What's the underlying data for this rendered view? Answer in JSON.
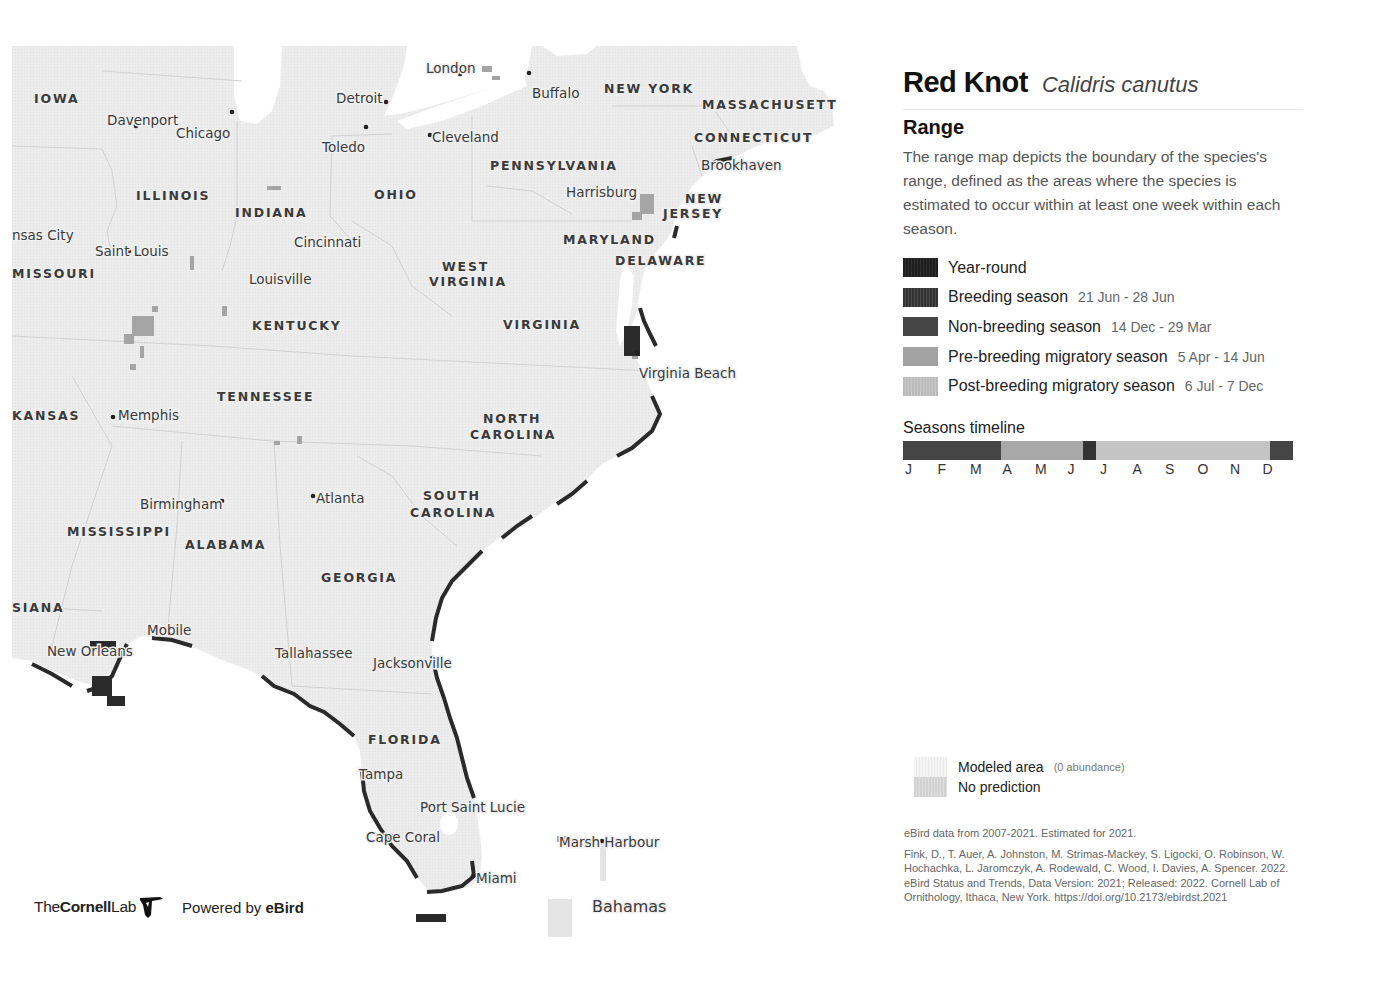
{
  "species": {
    "common_name": "Red Knot",
    "scientific_name": "Calidris canutus"
  },
  "range": {
    "heading": "Range",
    "description": "The range map depicts the boundary of the species's range, defined as the areas where the species is estimated to occur within at least one week within each season."
  },
  "legend": {
    "items": [
      {
        "label": "Year-round",
        "dates": "",
        "color": "#222222"
      },
      {
        "label": "Breeding season",
        "dates": "21 Jun - 28 Jun",
        "color": "#3e3e3e"
      },
      {
        "label": "Non-breeding season",
        "dates": "14 Dec - 29 Mar",
        "color": "#454545"
      },
      {
        "label": "Pre-breeding migratory season",
        "dates": "5 Apr - 14 Jun",
        "color": "#a2a2a2"
      },
      {
        "label": "Post-breeding migratory season",
        "dates": "6 Jul - 7 Dec",
        "color": "#bdbdbd"
      }
    ]
  },
  "timeline": {
    "title": "Seasons timeline",
    "months": [
      "J",
      "F",
      "M",
      "A",
      "M",
      "J",
      "J",
      "A",
      "S",
      "O",
      "N",
      "D"
    ],
    "segments": [
      {
        "season": "non-breeding",
        "start_pct": 0,
        "width_pct": 25,
        "color": "#454545"
      },
      {
        "season": "pre-breeding",
        "start_pct": 25,
        "width_pct": 21.2,
        "color": "#a8a8a8"
      },
      {
        "season": "breeding",
        "start_pct": 46.2,
        "width_pct": 3.4,
        "color": "#333333"
      },
      {
        "season": "post-breeding",
        "start_pct": 49.6,
        "width_pct": 44.4,
        "color": "#c4c4c4"
      },
      {
        "season": "non-breeding",
        "start_pct": 94,
        "width_pct": 6,
        "color": "#454545"
      }
    ]
  },
  "auxiliary_legend": {
    "modeled": {
      "label": "Modeled area",
      "note": "(0 abundance)",
      "color": "#f2f2f2"
    },
    "no_prediction": {
      "label": "No prediction",
      "color": "#d6d6d6"
    }
  },
  "citation": {
    "data_note": "eBird data from 2007-2021. Estimated for 2021.",
    "reference": "Fink, D., T. Auer, A. Johnston, M. Strimas-Mackey, S. Ligocki, O. Robinson, W. Hochachka, L. Jaromczyk, A. Rodewald, C. Wood, I. Davies, A. Spencer. 2022. eBird Status and Trends, Data Version: 2021; Released: 2022. Cornell Lab of Ornithology, Ithaca, New York. https://doi.org/10.2173/ebirdst.2021"
  },
  "footer": {
    "logo_the": "The",
    "logo_cornell": "Cornell",
    "logo_lab": "Lab",
    "powered_by": "Powered by ",
    "ebird": "eBird"
  },
  "map": {
    "states": [
      {
        "name": "IOWA",
        "x": 22,
        "y": 46
      },
      {
        "name": "ILLINOIS",
        "x": 124,
        "y": 143
      },
      {
        "name": "INDIANA",
        "x": 223,
        "y": 160
      },
      {
        "name": "OHIO",
        "x": 362,
        "y": 142
      },
      {
        "name": "NEW YORK",
        "x": 592,
        "y": 36
      },
      {
        "name": "MASSACHUSETTS",
        "x": 690,
        "y": 52
      },
      {
        "name": "CONNECTICUT",
        "x": 682,
        "y": 85
      },
      {
        "name": "PENNSYLVANIA",
        "x": 478,
        "y": 113
      },
      {
        "name": "NEW",
        "x": 673,
        "y": 146
      },
      {
        "name": "JERSEY",
        "x": 651,
        "y": 161
      },
      {
        "name": "MARYLAND",
        "x": 551,
        "y": 187
      },
      {
        "name": "DELAWARE",
        "x": 603,
        "y": 208
      },
      {
        "name": "MISSOURI",
        "x": 0,
        "y": 221
      },
      {
        "name": "WEST",
        "x": 430,
        "y": 214
      },
      {
        "name": "VIRGINIA",
        "x": 417,
        "y": 229
      },
      {
        "name": "KENTUCKY",
        "x": 240,
        "y": 273
      },
      {
        "name": "VIRGINIA",
        "x": 491,
        "y": 272
      },
      {
        "name": "TENNESSEE",
        "x": 205,
        "y": 344
      },
      {
        "name": "KANSAS",
        "x": 0,
        "y": 363
      },
      {
        "name": "NORTH",
        "x": 471,
        "y": 366
      },
      {
        "name": "CAROLINA",
        "x": 458,
        "y": 382
      },
      {
        "name": "SOUTH",
        "x": 411,
        "y": 443
      },
      {
        "name": "CAROLINA",
        "x": 398,
        "y": 460
      },
      {
        "name": "MISSISSIPPI",
        "x": 55,
        "y": 479
      },
      {
        "name": "ALABAMA",
        "x": 173,
        "y": 492
      },
      {
        "name": "GEORGIA",
        "x": 309,
        "y": 525
      },
      {
        "name": "SIANA",
        "x": 0,
        "y": 555
      },
      {
        "name": "FLORIDA",
        "x": 356,
        "y": 687
      }
    ],
    "cities": [
      {
        "name": "London",
        "lx": 414,
        "ly": 15,
        "dx": 448,
        "dy": 28
      },
      {
        "name": "Detroit",
        "lx": 324,
        "ly": 45,
        "dx": 374,
        "dy": 56
      },
      {
        "name": "Buffalo",
        "lx": 520,
        "ly": 40,
        "dx": 517,
        "dy": 27
      },
      {
        "name": "Davenport",
        "lx": 95,
        "ly": 67,
        "dx": 124,
        "dy": 80
      },
      {
        "name": "Chicago",
        "lx": 164,
        "ly": 80,
        "dx": 220,
        "dy": 66
      },
      {
        "name": "Toledo",
        "lx": 310,
        "ly": 94,
        "dx": 354,
        "dy": 81
      },
      {
        "name": "Cleveland",
        "lx": 420,
        "ly": 84,
        "dx": 418,
        "dy": 89
      },
      {
        "name": "Brookhaven",
        "lx": 689,
        "ly": 112,
        "dx": 724,
        "dy": 118
      },
      {
        "name": "Harrisburg",
        "lx": 554,
        "ly": 139,
        "dx": 586,
        "dy": 148
      },
      {
        "name": "nsas City",
        "lx": 0,
        "ly": 182,
        "dx": -20,
        "dy": -20
      },
      {
        "name": "Cincinnati",
        "lx": 282,
        "ly": 189,
        "dx": 312,
        "dy": 195
      },
      {
        "name": "Saint Louis",
        "lx": 83,
        "ly": 198,
        "dx": 117,
        "dy": 205
      },
      {
        "name": "Louisville",
        "lx": 237,
        "ly": 226,
        "dx": 265,
        "dy": 233
      },
      {
        "name": "Virginia Beach",
        "lx": 627,
        "ly": 320,
        "dx": 625,
        "dy": 307
      },
      {
        "name": "Memphis",
        "lx": 106,
        "ly": 362,
        "dx": 101,
        "dy": 371
      },
      {
        "name": "Birmingham",
        "lx": 128,
        "ly": 451,
        "dx": 210,
        "dy": 455
      },
      {
        "name": "Atlanta",
        "lx": 304,
        "ly": 445,
        "dx": 301,
        "dy": 450
      },
      {
        "name": "Mobile",
        "lx": 135,
        "ly": 577,
        "dx": 155,
        "dy": 584
      },
      {
        "name": "New Orleans",
        "lx": 35,
        "ly": 598,
        "dx": 78,
        "dy": 606
      },
      {
        "name": "Tallahassee",
        "lx": 263,
        "ly": 600,
        "dx": 298,
        "dy": 609
      },
      {
        "name": "Jacksonville",
        "lx": 361,
        "ly": 610,
        "dx": 403,
        "dy": 618
      },
      {
        "name": "Tampa",
        "lx": 347,
        "ly": 721,
        "dx": 358,
        "dy": 727
      },
      {
        "name": "Port Saint Lucie",
        "lx": 408,
        "ly": 754,
        "dx": 455,
        "dy": 763
      },
      {
        "name": "Cape Coral",
        "lx": 354,
        "ly": 784,
        "dx": 380,
        "dy": 790
      },
      {
        "name": "Marsh Harbour",
        "lx": 547,
        "ly": 789,
        "dx": 590,
        "dy": 795
      },
      {
        "name": "Miami",
        "lx": 464,
        "ly": 825,
        "dx": 461,
        "dy": 830
      },
      {
        "name": "Bahamas",
        "lx": 580,
        "ly": 854,
        "dx": -20,
        "dy": -20
      }
    ]
  }
}
